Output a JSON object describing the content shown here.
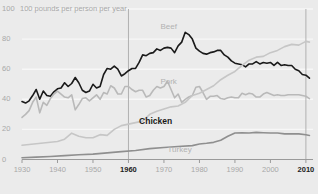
{
  "chart_data": {
    "type": "line",
    "title": "",
    "subtitle": "",
    "unit_note": "100  pounds per person per year",
    "xlabel": "",
    "ylabel": "pounds per person per year",
    "xlim": [
      1930,
      2012
    ],
    "ylim": [
      0,
      100
    ],
    "grid": true,
    "legend_position": "inline-annotations",
    "y_ticks": [
      {
        "value": 100,
        "label": "100"
      },
      {
        "value": 80,
        "label": "80"
      },
      {
        "value": 60,
        "label": "60"
      },
      {
        "value": 40,
        "label": "40"
      },
      {
        "value": 20,
        "label": "20"
      },
      {
        "value": 0,
        "label": "0"
      }
    ],
    "x_ticks": [
      {
        "value": 1930,
        "label": "1930",
        "bold": false
      },
      {
        "value": 1940,
        "label": "1940",
        "bold": false
      },
      {
        "value": 1950,
        "label": "1950",
        "bold": false
      },
      {
        "value": 1960,
        "label": "1960",
        "bold": true
      },
      {
        "value": 1970,
        "label": "1970",
        "bold": false
      },
      {
        "value": 1980,
        "label": "1980",
        "bold": false
      },
      {
        "value": 1990,
        "label": "1990",
        "bold": false
      },
      {
        "value": 2000,
        "label": "2000",
        "bold": false
      },
      {
        "value": 2010,
        "label": "2010",
        "bold": true
      }
    ],
    "highlight_years": [
      1960,
      2010
    ],
    "colors": {
      "background": "#ebebeb",
      "gridline": "#f7f7f7",
      "axis": "#9a9a9a",
      "beef": "#1a1a1a",
      "pork": "#b9b9b9",
      "chicken": "#c6c6c6",
      "turkey": "#8f8f8f",
      "label_faint": "#b2b2b2",
      "label_dark": "#1a1a1a",
      "marker_line": "#b0b0b0"
    },
    "annotations": [
      {
        "name": "Beef",
        "x": 1969,
        "y": 88,
        "style": "faint"
      },
      {
        "name": "Pork",
        "x": 1969,
        "y": 51.5,
        "style": "faint"
      },
      {
        "name": "Chicken",
        "x": 1963,
        "y": 25,
        "style": "dark"
      },
      {
        "name": "Turkey",
        "x": 1971,
        "y": 6.5,
        "style": "faint"
      }
    ],
    "series": [
      {
        "name": "Beef",
        "color": "#1a1a1a",
        "width": 1.6,
        "x": [
          1930,
          1931,
          1932,
          1933,
          1934,
          1935,
          1936,
          1937,
          1938,
          1939,
          1940,
          1941,
          1942,
          1943,
          1944,
          1945,
          1946,
          1947,
          1948,
          1949,
          1950,
          1951,
          1952,
          1953,
          1954,
          1955,
          1956,
          1957,
          1958,
          1959,
          1960,
          1961,
          1962,
          1963,
          1964,
          1965,
          1966,
          1967,
          1968,
          1969,
          1970,
          1971,
          1972,
          1973,
          1974,
          1975,
          1976,
          1977,
          1978,
          1979,
          1980,
          1981,
          1982,
          1983,
          1984,
          1985,
          1986,
          1987,
          1988,
          1989,
          1990,
          1991,
          1992,
          1993,
          1994,
          1995,
          1996,
          1997,
          1998,
          1999,
          2000,
          2001,
          2002,
          2003,
          2004,
          2005,
          2006,
          2007,
          2008,
          2009,
          2010,
          2011
        ],
        "y": [
          38.5,
          37.5,
          39.0,
          42.5,
          46.5,
          40.0,
          45.5,
          42.5,
          42.0,
          45.0,
          47.0,
          47.5,
          51.0,
          48.5,
          50.5,
          54.5,
          51.0,
          46.0,
          44.5,
          45.5,
          50.0,
          47.5,
          48.5,
          56.5,
          60.5,
          60.0,
          62.0,
          60.0,
          55.5,
          57.0,
          59.0,
          60.5,
          60.5,
          64.5,
          69.5,
          69.0,
          70.5,
          71.0,
          73.5,
          72.5,
          74.0,
          74.5,
          74.0,
          71.0,
          75.5,
          78.0,
          84.5,
          83.0,
          80.0,
          74.0,
          72.0,
          70.5,
          70.0,
          71.0,
          71.5,
          72.5,
          72.5,
          69.5,
          68.0,
          65.5,
          64.0,
          63.5,
          63.0,
          61.5,
          63.5,
          63.5,
          65.0,
          63.5,
          64.5,
          64.0,
          64.5,
          62.5,
          64.5,
          62.5,
          63.0,
          62.5,
          62.5,
          60.0,
          59.0,
          56.5,
          56.0,
          54.0
        ]
      },
      {
        "name": "Pork",
        "color": "#b9b9b9",
        "width": 1.6,
        "x": [
          1930,
          1931,
          1932,
          1933,
          1934,
          1935,
          1936,
          1937,
          1938,
          1939,
          1940,
          1941,
          1942,
          1943,
          1944,
          1945,
          1946,
          1947,
          1948,
          1949,
          1950,
          1951,
          1952,
          1953,
          1954,
          1955,
          1956,
          1957,
          1958,
          1959,
          1960,
          1961,
          1962,
          1963,
          1964,
          1965,
          1966,
          1967,
          1968,
          1969,
          1970,
          1971,
          1972,
          1973,
          1974,
          1975,
          1976,
          1977,
          1978,
          1979,
          1980,
          1981,
          1982,
          1983,
          1984,
          1985,
          1986,
          1987,
          1988,
          1989,
          1990,
          1991,
          1992,
          1993,
          1994,
          1995,
          1996,
          1997,
          1998,
          1999,
          2000,
          2001,
          2002,
          2003,
          2004,
          2005,
          2006,
          2007,
          2008,
          2009,
          2010,
          2011
        ],
        "y": [
          28.0,
          30.0,
          32.5,
          38.0,
          41.5,
          31.0,
          38.0,
          36.0,
          40.5,
          43.5,
          45.5,
          43.5,
          41.5,
          41.0,
          43.0,
          33.0,
          36.5,
          40.5,
          41.0,
          39.0,
          41.0,
          43.0,
          40.0,
          44.5,
          43.5,
          49.0,
          47.5,
          43.5,
          43.5,
          48.5,
          48.5,
          46.5,
          45.0,
          46.0,
          46.0,
          41.5,
          42.5,
          46.0,
          48.5,
          47.5,
          48.5,
          52.0,
          46.5,
          41.0,
          43.5,
          38.0,
          40.0,
          41.5,
          42.5,
          48.0,
          48.5,
          44.5,
          40.0,
          42.0,
          42.0,
          42.5,
          40.5,
          40.0,
          41.0,
          41.5,
          41.0,
          41.0,
          44.0,
          43.0,
          44.0,
          43.5,
          41.5,
          41.5,
          43.5,
          44.5,
          43.5,
          42.5,
          43.0,
          42.5,
          42.5,
          43.0,
          43.0,
          43.0,
          43.0,
          42.5,
          42.0,
          40.5
        ]
      },
      {
        "name": "Chicken",
        "color": "#c6c6c6",
        "width": 1.6,
        "x": [
          1930,
          1932,
          1934,
          1936,
          1938,
          1940,
          1942,
          1944,
          1946,
          1948,
          1950,
          1952,
          1954,
          1956,
          1958,
          1960,
          1962,
          1964,
          1966,
          1968,
          1970,
          1972,
          1974,
          1976,
          1978,
          1980,
          1982,
          1984,
          1986,
          1988,
          1990,
          1992,
          1994,
          1996,
          1998,
          2000,
          2002,
          2004,
          2006,
          2008,
          2010,
          2011
        ],
        "y": [
          9.5,
          10.0,
          10.5,
          11.0,
          11.5,
          12.0,
          13.5,
          17.5,
          15.5,
          14.5,
          14.5,
          16.5,
          16.0,
          20.0,
          22.5,
          23.5,
          24.5,
          25.5,
          30.0,
          32.0,
          33.5,
          35.0,
          35.5,
          38.0,
          42.5,
          44.0,
          46.5,
          49.0,
          53.0,
          56.0,
          58.5,
          62.5,
          66.0,
          68.0,
          68.5,
          71.0,
          72.5,
          75.0,
          76.5,
          76.0,
          78.5,
          78.0
        ]
      },
      {
        "name": "Turkey",
        "color": "#8f8f8f",
        "width": 1.6,
        "x": [
          1930,
          1934,
          1938,
          1942,
          1946,
          1950,
          1954,
          1958,
          1962,
          1966,
          1970,
          1974,
          1978,
          1980,
          1982,
          1984,
          1986,
          1988,
          1990,
          1992,
          1994,
          1996,
          1998,
          2000,
          2002,
          2004,
          2006,
          2008,
          2010,
          2011
        ],
        "y": [
          1.2,
          1.6,
          2.0,
          2.6,
          3.2,
          3.6,
          4.4,
          5.2,
          6.0,
          7.2,
          8.0,
          8.6,
          9.2,
          10.3,
          10.8,
          11.4,
          12.8,
          15.4,
          17.6,
          17.8,
          17.6,
          18.0,
          17.8,
          17.6,
          17.6,
          17.0,
          17.0,
          17.0,
          16.4,
          16.0
        ]
      }
    ]
  }
}
